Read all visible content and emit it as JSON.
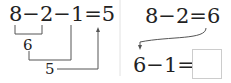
{
  "left": {
    "expression": "8−2−1=5",
    "step1_result": "6",
    "step2_result": "5"
  },
  "right": {
    "expression1": "8−2=6",
    "expression2": "6−1=",
    "answer_box": ""
  },
  "colors": {
    "line": "#555555",
    "divider": "#dddddd"
  }
}
